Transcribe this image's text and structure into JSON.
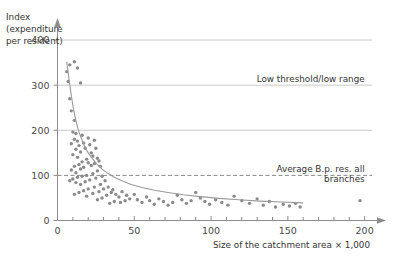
{
  "chart_data": {
    "type": "scatter",
    "title": "",
    "xlabel": "Size of the catchment area × 1,000",
    "ylabel_lines": [
      "Index",
      "(expenditure",
      "per resident)"
    ],
    "ylabel": "Index (expenditure per resident)",
    "xlim": [
      0,
      210
    ],
    "ylim": [
      0,
      440
    ],
    "xticks": [
      0,
      50,
      100,
      150,
      200
    ],
    "xtick_labels": [
      "0",
      "50",
      "100",
      "150",
      "200"
    ],
    "xminor_step": 10,
    "yticks": [
      0,
      100,
      200,
      300,
      400
    ],
    "ytick_labels": [
      "0",
      "100",
      "200",
      "300",
      "400"
    ],
    "grid": "horizontal-only",
    "legend": "none",
    "gridlines": [
      {
        "value": 400,
        "style": "solid"
      },
      {
        "value": 300,
        "style": "solid"
      },
      {
        "value": 200,
        "style": "solid"
      },
      {
        "value": 100,
        "style": "dashed"
      }
    ],
    "annotations": [
      {
        "text": "Low threshold/low range",
        "lines": [
          "Low threshold/low range"
        ],
        "x": 200,
        "y": 308,
        "anchor": "end",
        "refers_to_gridline": 300
      },
      {
        "text": "Average B.p. res. all branches",
        "lines": [
          "Average B.p. res. all",
          "branches"
        ],
        "x": 200,
        "y": 108,
        "anchor": "end",
        "refers_to_gridline": 100
      }
    ],
    "series": [
      {
        "name": "Branches",
        "marker": "dot",
        "color": "#8a8a8a",
        "points": [
          [
            6,
            330
          ],
          [
            8,
            345
          ],
          [
            11,
            352
          ],
          [
            13,
            338
          ],
          [
            15,
            305
          ],
          [
            7,
            308
          ],
          [
            8,
            270
          ],
          [
            9,
            243
          ],
          [
            11,
            222
          ],
          [
            10,
            196
          ],
          [
            12,
            193
          ],
          [
            11,
            180
          ],
          [
            13,
            176
          ],
          [
            9,
            170
          ],
          [
            14,
            166
          ],
          [
            16,
            189
          ],
          [
            17,
            172
          ],
          [
            12,
            158
          ],
          [
            15,
            152
          ],
          [
            10,
            146
          ],
          [
            13,
            140
          ],
          [
            18,
            160
          ],
          [
            20,
            183
          ],
          [
            21,
            168
          ],
          [
            22,
            150
          ],
          [
            24,
            178
          ],
          [
            25,
            160
          ],
          [
            23,
            143
          ],
          [
            26,
            138
          ],
          [
            19,
            136
          ],
          [
            16,
            130
          ],
          [
            14,
            124
          ],
          [
            11,
            120
          ],
          [
            9,
            112
          ],
          [
            12,
            106
          ],
          [
            15,
            114
          ],
          [
            17,
            118
          ],
          [
            20,
            128
          ],
          [
            22,
            122
          ],
          [
            24,
            126
          ],
          [
            27,
            132
          ],
          [
            28,
            120
          ],
          [
            26,
            110
          ],
          [
            23,
            104
          ],
          [
            19,
            100
          ],
          [
            16,
            98
          ],
          [
            13,
            96
          ],
          [
            10,
            92
          ],
          [
            8,
            88
          ],
          [
            12,
            84
          ],
          [
            15,
            80
          ],
          [
            18,
            86
          ],
          [
            21,
            90
          ],
          [
            25,
            94
          ],
          [
            29,
            98
          ],
          [
            31,
            88
          ],
          [
            28,
            80
          ],
          [
            24,
            74
          ],
          [
            20,
            70
          ],
          [
            17,
            66
          ],
          [
            14,
            62
          ],
          [
            11,
            58
          ],
          [
            19,
            54
          ],
          [
            23,
            60
          ],
          [
            27,
            64
          ],
          [
            30,
            70
          ],
          [
            33,
            74
          ],
          [
            35,
            62
          ],
          [
            32,
            56
          ],
          [
            29,
            50
          ],
          [
            26,
            46
          ],
          [
            36,
            68
          ],
          [
            38,
            58
          ],
          [
            40,
            52
          ],
          [
            42,
            64
          ],
          [
            45,
            56
          ],
          [
            44,
            44
          ],
          [
            41,
            40
          ],
          [
            37,
            42
          ],
          [
            34,
            38
          ],
          [
            47,
            48
          ],
          [
            50,
            58
          ],
          [
            52,
            46
          ],
          [
            55,
            40
          ],
          [
            58,
            52
          ],
          [
            60,
            44
          ],
          [
            63,
            36
          ],
          [
            66,
            48
          ],
          [
            69,
            42
          ],
          [
            72,
            34
          ],
          [
            75,
            40
          ],
          [
            78,
            56
          ],
          [
            81,
            46
          ],
          [
            84,
            38
          ],
          [
            87,
            44
          ],
          [
            90,
            62
          ],
          [
            93,
            50
          ],
          [
            96,
            42
          ],
          [
            99,
            36
          ],
          [
            103,
            46
          ],
          [
            107,
            40
          ],
          [
            111,
            34
          ],
          [
            115,
            54
          ],
          [
            120,
            44
          ],
          [
            125,
            38
          ],
          [
            130,
            48
          ],
          [
            134,
            34
          ],
          [
            138,
            42
          ],
          [
            142,
            30
          ],
          [
            147,
            36
          ],
          [
            151,
            32
          ],
          [
            155,
            38
          ],
          [
            158,
            30
          ],
          [
            197,
            44
          ]
        ]
      }
    ],
    "fit_curve": {
      "name": "fitted trend",
      "type": "exponential-decay",
      "color": "#9a9a9a",
      "points": [
        [
          6,
          352
        ],
        [
          8,
          300
        ],
        [
          10,
          255
        ],
        [
          12,
          220
        ],
        [
          14,
          196
        ],
        [
          16,
          178
        ],
        [
          18,
          162
        ],
        [
          20,
          150
        ],
        [
          23,
          136
        ],
        [
          26,
          124
        ],
        [
          29,
          114
        ],
        [
          33,
          104
        ],
        [
          37,
          96
        ],
        [
          42,
          88
        ],
        [
          48,
          80
        ],
        [
          55,
          73
        ],
        [
          63,
          67
        ],
        [
          72,
          62
        ],
        [
          82,
          57
        ],
        [
          93,
          53
        ],
        [
          105,
          49
        ],
        [
          118,
          46
        ],
        [
          132,
          43
        ],
        [
          146,
          41
        ],
        [
          160,
          39
        ]
      ]
    }
  },
  "axes": {
    "y_arrow": true,
    "x_arrow": true
  }
}
